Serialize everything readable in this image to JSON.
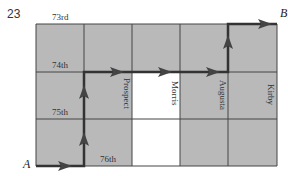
{
  "problem_number": "23",
  "points": {
    "start": "A",
    "end": "B"
  },
  "streets_horizontal": [
    "73rd",
    "74th",
    "75th",
    "76th"
  ],
  "streets_vertical": [
    "Prospect",
    "Morris",
    "Augusta",
    "Kirby"
  ],
  "grid": {
    "columns": 5,
    "rows": 3,
    "x_lines": [
      36,
      84,
      132,
      180,
      228,
      277
    ],
    "y_lines": [
      24,
      72,
      119,
      166
    ],
    "white_cells": [
      [
        1,
        2
      ],
      [
        2,
        2
      ]
    ],
    "gray_color": "#b9b9b9",
    "line_color": "#333333"
  },
  "path": {
    "description": "A right to first corner, up to 74th, right along 74th to Augusta line, up to 73rd, right to B",
    "color": "#333333"
  }
}
